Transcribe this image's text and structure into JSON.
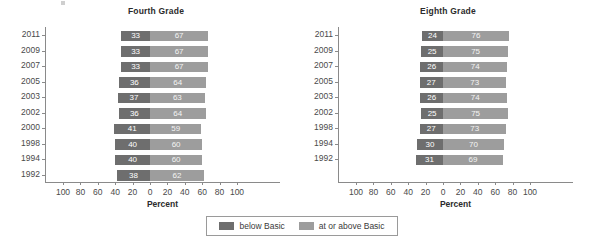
{
  "chart_data": {
    "type": "bar",
    "subtype": "diverging-stacked-horizontal",
    "title": "",
    "xlabel": "Percent",
    "ylabel": "",
    "xlim": [
      -100,
      100
    ],
    "xticks": [
      100,
      80,
      60,
      40,
      20,
      0,
      20,
      40,
      60,
      80,
      100
    ],
    "grid": false,
    "legend_position": "bottom-center",
    "series_names": [
      "below Basic",
      "at or above Basic"
    ],
    "colors": {
      "below_basic": "#6e6e6e",
      "at_or_above_basic": "#9d9d9d",
      "axis": "#8a8a8a",
      "text": "#3a3a3a",
      "background": "#ffffff"
    },
    "panels": [
      {
        "title": "Fourth Grade",
        "categories": [
          "2011",
          "2009",
          "2007",
          "2005",
          "2003",
          "2002",
          "2000",
          "1998",
          "1994",
          "1992"
        ],
        "series": [
          {
            "name": "below Basic",
            "values": [
              33,
              33,
              33,
              36,
              37,
              36,
              41,
              40,
              40,
              38
            ]
          },
          {
            "name": "at or above Basic",
            "values": [
              67,
              67,
              67,
              64,
              63,
              64,
              59,
              60,
              60,
              62
            ]
          }
        ]
      },
      {
        "title": "Eighth Grade",
        "categories": [
          "2011",
          "2009",
          "2007",
          "2005",
          "2003",
          "2002",
          "1998",
          "1994",
          "1992"
        ],
        "series": [
          {
            "name": "below Basic",
            "values": [
              24,
              25,
              26,
              27,
              26,
              25,
              27,
              30,
              31
            ]
          },
          {
            "name": "at or above Basic",
            "values": [
              76,
              75,
              74,
              73,
              74,
              75,
              73,
              70,
              69
            ]
          }
        ]
      }
    ]
  },
  "legend": {
    "items": [
      {
        "label": "below Basic",
        "color": "#6e6e6e"
      },
      {
        "label": "at or above Basic",
        "color": "#9d9d9d"
      }
    ]
  },
  "axis": {
    "xlabel": "Percent"
  }
}
